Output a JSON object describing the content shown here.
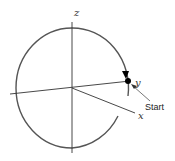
{
  "diagram": {
    "axes": {
      "z_label": "z",
      "y_label": "y",
      "x_label": "x"
    },
    "annotation": {
      "start_label": "Start"
    },
    "colors": {
      "stroke": "#555555",
      "axis": "#333333",
      "marker": "#000000",
      "background": "#ffffff"
    }
  }
}
